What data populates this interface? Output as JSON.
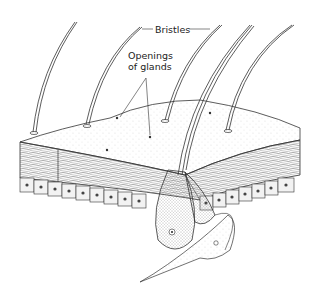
{
  "figure": {
    "type": "anatomical-illustration",
    "labels": {
      "bristles": "Bristles",
      "openings_line1": "Openings",
      "openings_line2": "of glands"
    }
  }
}
